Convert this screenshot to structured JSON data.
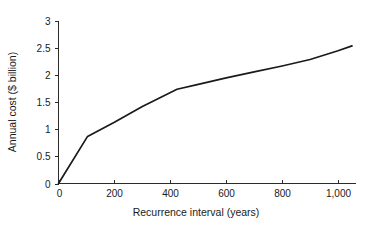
{
  "chart_data": {
    "type": "line",
    "title": "",
    "xlabel": "Recurrence interval (years)",
    "ylabel": "Annual cost ($ billion)",
    "xlim": [
      0,
      1060
    ],
    "ylim": [
      0,
      3
    ],
    "grid": false,
    "legend": false,
    "line_color": "#1a1a1a",
    "background_color": "#ffffff",
    "x_ticks": [
      0,
      200,
      400,
      600,
      800,
      1000
    ],
    "x_tick_labels": [
      "0",
      "200",
      "400",
      "600",
      "800",
      "1,000"
    ],
    "y_ticks": [
      0,
      0.5,
      1,
      1.5,
      2,
      2.5,
      3
    ],
    "y_tick_labels": [
      "0",
      "0.5",
      "1",
      "1.5",
      "2",
      "2.5",
      "3"
    ],
    "series": [
      {
        "name": "Annual cost",
        "x": [
          0,
          104,
          200,
          300,
          424,
          500,
          600,
          700,
          800,
          900,
          1000,
          1050
        ],
        "values": [
          0,
          0.87,
          1.13,
          1.42,
          1.74,
          1.83,
          1.95,
          2.06,
          2.17,
          2.29,
          2.45,
          2.54
        ]
      }
    ]
  },
  "axes": {
    "y_title": "Annual cost ($ billion)",
    "x_title": "Recurrence interval (years)"
  }
}
